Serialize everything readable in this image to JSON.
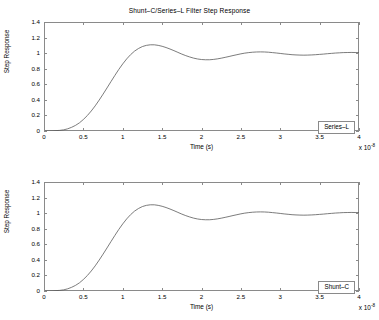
{
  "figure": {
    "background": "#ffffff",
    "axis_color": "#8a8a8a",
    "line_color": "#5a5a5a",
    "width": 379,
    "height": 320
  },
  "chart_data": [
    {
      "type": "line",
      "title": "Shunt–C/Series–L Filter Step Response",
      "xlabel": "Time (s)",
      "ylabel": "Step Response",
      "x_exponent_label": "x 10",
      "x_exponent_value": "-8",
      "xlim": [
        0,
        4e-08
      ],
      "ylim": [
        0,
        1.4
      ],
      "xticks": [
        0,
        0.5,
        1,
        1.5,
        2,
        2.5,
        3,
        3.5,
        4
      ],
      "xticklabels": [
        "0",
        "0.5",
        "1",
        "1.5",
        "2",
        "2.5",
        "3",
        "3.5",
        "4"
      ],
      "yticks": [
        0,
        0.2,
        0.4,
        0.6,
        0.8,
        1,
        1.2,
        1.4
      ],
      "yticklabels": [
        "0",
        "0.2",
        "0.4",
        "0.6",
        "0.8",
        "1",
        "1.2",
        "1.4"
      ],
      "grid": false,
      "legend": "Series–L",
      "legend_position": "lower-right",
      "series": [
        {
          "name": "Series–L",
          "x": [
            0,
            0.1,
            0.2,
            0.25,
            0.3,
            0.35,
            0.4,
            0.45,
            0.5,
            0.55,
            0.6,
            0.65,
            0.7,
            0.75,
            0.8,
            0.85,
            0.9,
            0.95,
            1.0,
            1.05,
            1.1,
            1.15,
            1.2,
            1.25,
            1.3,
            1.35,
            1.4,
            1.45,
            1.5,
            1.55,
            1.6,
            1.65,
            1.7,
            1.75,
            1.8,
            1.85,
            1.9,
            1.95,
            2.0,
            2.05,
            2.1,
            2.15,
            2.2,
            2.25,
            2.3,
            2.35,
            2.4,
            2.45,
            2.5,
            2.55,
            2.6,
            2.65,
            2.7,
            2.75,
            2.8,
            2.85,
            2.9,
            2.95,
            3.0,
            3.05,
            3.1,
            3.15,
            3.2,
            3.25,
            3.3,
            3.35,
            3.4,
            3.45,
            3.5,
            3.55,
            3.6,
            3.65,
            3.7,
            3.75,
            3.8,
            3.85,
            3.9,
            3.95,
            4.0
          ],
          "y": [
            0,
            0.002,
            0.008,
            0.015,
            0.028,
            0.047,
            0.072,
            0.105,
            0.148,
            0.198,
            0.257,
            0.323,
            0.396,
            0.473,
            0.553,
            0.634,
            0.714,
            0.791,
            0.862,
            0.926,
            0.981,
            1.026,
            1.06,
            1.085,
            1.1,
            1.107,
            1.107,
            1.1,
            1.088,
            1.072,
            1.053,
            1.032,
            1.01,
            0.988,
            0.968,
            0.951,
            0.936,
            0.925,
            0.918,
            0.915,
            0.915,
            0.919,
            0.926,
            0.935,
            0.946,
            0.957,
            0.969,
            0.98,
            0.991,
            1.0,
            1.007,
            1.012,
            1.015,
            1.016,
            1.015,
            1.012,
            1.007,
            1.002,
            0.996,
            0.99,
            0.985,
            0.98,
            0.977,
            0.975,
            0.974,
            0.975,
            0.977,
            0.98,
            0.984,
            0.988,
            0.993,
            0.997,
            1.001,
            1.004,
            1.007,
            1.008,
            1.009,
            1.008,
            1.007
          ]
        }
      ]
    },
    {
      "type": "line",
      "title": "",
      "xlabel": "Time (s)",
      "ylabel": "Step Response",
      "x_exponent_label": "x 10",
      "x_exponent_value": "-8",
      "xlim": [
        0,
        4e-08
      ],
      "ylim": [
        0,
        1.4
      ],
      "xticks": [
        0,
        0.5,
        1,
        1.5,
        2,
        2.5,
        3,
        3.5,
        4
      ],
      "xticklabels": [
        "0",
        "0.5",
        "1",
        "1.5",
        "2",
        "2.5",
        "3",
        "3.5",
        "4"
      ],
      "yticks": [
        0,
        0.2,
        0.4,
        0.6,
        0.8,
        1,
        1.2,
        1.4
      ],
      "yticklabels": [
        "0",
        "0.2",
        "0.4",
        "0.6",
        "0.8",
        "1",
        "1.2",
        "1.4"
      ],
      "grid": false,
      "legend": "Shunt–C",
      "legend_position": "lower-right",
      "series": [
        {
          "name": "Shunt–C",
          "x": [
            0,
            0.1,
            0.2,
            0.25,
            0.3,
            0.35,
            0.4,
            0.45,
            0.5,
            0.55,
            0.6,
            0.65,
            0.7,
            0.75,
            0.8,
            0.85,
            0.9,
            0.95,
            1.0,
            1.05,
            1.1,
            1.15,
            1.2,
            1.25,
            1.3,
            1.35,
            1.4,
            1.45,
            1.5,
            1.55,
            1.6,
            1.65,
            1.7,
            1.75,
            1.8,
            1.85,
            1.9,
            1.95,
            2.0,
            2.05,
            2.1,
            2.15,
            2.2,
            2.25,
            2.3,
            2.35,
            2.4,
            2.45,
            2.5,
            2.55,
            2.6,
            2.65,
            2.7,
            2.75,
            2.8,
            2.85,
            2.9,
            2.95,
            3.0,
            3.05,
            3.1,
            3.15,
            3.2,
            3.25,
            3.3,
            3.35,
            3.4,
            3.45,
            3.5,
            3.55,
            3.6,
            3.65,
            3.7,
            3.75,
            3.8,
            3.85,
            3.9,
            3.95,
            4.0
          ],
          "y": [
            0,
            0.002,
            0.008,
            0.015,
            0.028,
            0.047,
            0.072,
            0.105,
            0.148,
            0.198,
            0.257,
            0.323,
            0.396,
            0.473,
            0.553,
            0.634,
            0.714,
            0.791,
            0.862,
            0.926,
            0.981,
            1.026,
            1.06,
            1.085,
            1.1,
            1.107,
            1.107,
            1.1,
            1.088,
            1.072,
            1.053,
            1.032,
            1.01,
            0.988,
            0.968,
            0.951,
            0.936,
            0.925,
            0.918,
            0.915,
            0.915,
            0.919,
            0.926,
            0.935,
            0.946,
            0.957,
            0.969,
            0.98,
            0.991,
            1.0,
            1.007,
            1.012,
            1.015,
            1.016,
            1.015,
            1.012,
            1.007,
            1.002,
            0.996,
            0.99,
            0.985,
            0.98,
            0.977,
            0.975,
            0.974,
            0.975,
            0.977,
            0.98,
            0.984,
            0.988,
            0.993,
            0.997,
            1.001,
            1.004,
            1.007,
            1.008,
            1.009,
            1.008,
            1.007
          ]
        }
      ]
    }
  ]
}
